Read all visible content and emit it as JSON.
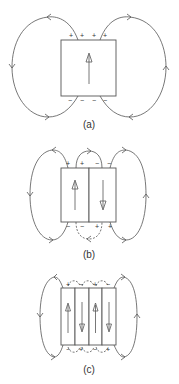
{
  "figure": {
    "panels": [
      {
        "id": "a",
        "caption": "(a)",
        "domains": [
          {
            "magnetization": "up"
          }
        ],
        "top_charges": [
          "+",
          "+",
          "+",
          "+"
        ],
        "bottom_charges": [
          "−",
          "−",
          "−",
          "−"
        ]
      },
      {
        "id": "b",
        "caption": "(b)",
        "domains": [
          {
            "magnetization": "up"
          },
          {
            "magnetization": "down"
          }
        ],
        "top_charges": [
          "+",
          "+",
          "−",
          "−"
        ],
        "bottom_charges": [
          "−",
          "−",
          "+",
          "+"
        ]
      },
      {
        "id": "c",
        "caption": "(c)",
        "domains": [
          {
            "magnetization": "up"
          },
          {
            "magnetization": "down"
          },
          {
            "magnetization": "up"
          },
          {
            "magnetization": "down"
          }
        ],
        "top_charges": [
          "+",
          "−",
          "+",
          "−"
        ],
        "bottom_charges": [
          "−",
          "+",
          "−",
          "+"
        ]
      }
    ],
    "colors": {
      "line": "#555555",
      "text": "#333333",
      "background": "#ffffff"
    }
  }
}
